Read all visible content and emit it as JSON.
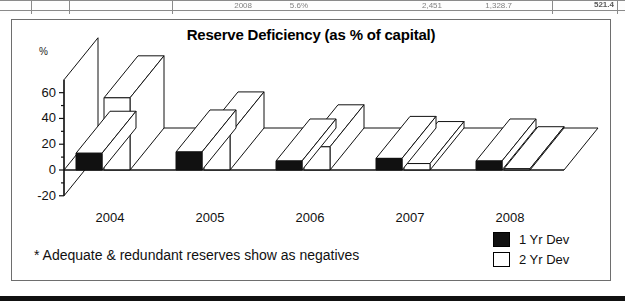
{
  "table_strip": {
    "cells": [
      {
        "text": "2008",
        "x": 212,
        "y": 2,
        "w": 40,
        "bold": false
      },
      {
        "text": "5.6%",
        "x": 272,
        "y": 2,
        "w": 36,
        "bold": false
      },
      {
        "text": "2,451",
        "x": 404,
        "y": 2,
        "w": 38,
        "bold": false
      },
      {
        "text": "1,328.7",
        "x": 466,
        "y": 2,
        "w": 46,
        "bold": false
      },
      {
        "text": "521.4",
        "x": 566,
        "y": 1,
        "w": 48,
        "bold": true
      }
    ]
  },
  "chart": {
    "title": "Reserve Deficiency (as % of capital)",
    "y_unit": "%",
    "footnote": "* Adequate & redundant reserves show as negatives",
    "legend": [
      {
        "label": "1 Yr Dev",
        "swatch": "black",
        "color": "#111111"
      },
      {
        "label": "2 Yr Dev",
        "swatch": "white",
        "color": "#ffffff"
      }
    ]
  },
  "chart_data": {
    "type": "bar",
    "title": "Reserve Deficiency (as % of capital)",
    "xlabel": "",
    "ylabel": "%",
    "categories": [
      "2004",
      "2005",
      "2006",
      "2007",
      "2008"
    ],
    "series": [
      {
        "name": "1 Yr Dev",
        "color": "#111111",
        "values": [
          13,
          14,
          7,
          9,
          7
        ]
      },
      {
        "name": "2 Yr Dev",
        "color": "#ffffff",
        "values": [
          56,
          28,
          18,
          5,
          1
        ]
      }
    ],
    "ylim": [
      -20,
      70
    ],
    "yticks": [
      -20,
      0,
      20,
      40,
      60
    ],
    "yticks_minor": [
      -10,
      10,
      30,
      50
    ],
    "grid": false,
    "legend_position": "bottom-right",
    "projection": "3d",
    "annotations": [
      "* Adequate & redundant reserves show as negatives"
    ]
  }
}
